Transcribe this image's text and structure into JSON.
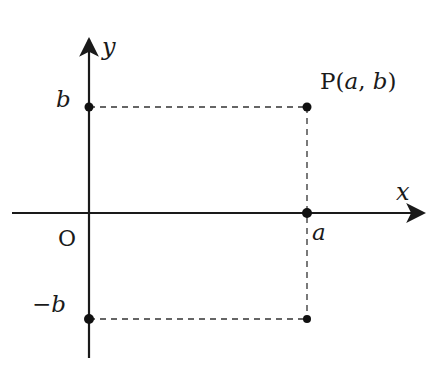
{
  "diagram": {
    "type": "coordinate-plane",
    "axes": {
      "x_label": "x",
      "y_label": "y",
      "origin_label": "O"
    },
    "labels": {
      "b": "b",
      "neg_b": "−b",
      "a": "a",
      "point_P": "P(",
      "point_P_a": "a",
      "point_P_comma": ", ",
      "point_P_b": "b",
      "point_P_close": ")"
    },
    "points": [
      {
        "name": "b-on-y-axis",
        "coords": "(0, b)"
      },
      {
        "name": "P",
        "coords": "(a, b)"
      },
      {
        "name": "a-on-x-axis",
        "coords": "(a, 0)"
      },
      {
        "name": "neg-b-on-y-axis",
        "coords": "(0, -b)"
      },
      {
        "name": "reflection-point",
        "coords": "(a, -b)"
      }
    ],
    "colors": {
      "ink": "#1a1a1a",
      "background": "#ffffff"
    }
  }
}
